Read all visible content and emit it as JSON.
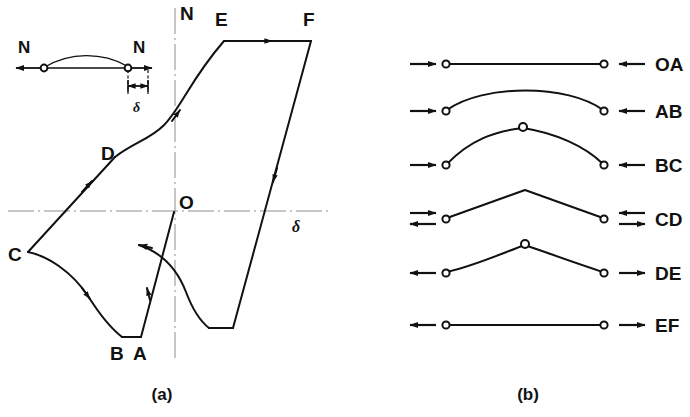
{
  "figure": {
    "panels": [
      {
        "id": "a",
        "caption": "(a)",
        "type": "load-deflection-hysteresis",
        "axes": {
          "vertical_label": "N",
          "horizontal_label": "δ"
        },
        "origin_label": "O",
        "point_labels": [
          "A",
          "B",
          "C",
          "D",
          "E",
          "F"
        ],
        "inset": {
          "left_force_label": "N",
          "right_force_label": "N",
          "dimension_label": "δ"
        }
      },
      {
        "id": "b",
        "caption": "(b)",
        "type": "strut-shape-sequence",
        "rows": [
          {
            "label": "OA",
            "shape": "straight",
            "hinge_at_apex": false,
            "left_arrows": 1,
            "right_arrows": 1,
            "left_direction": "right",
            "right_direction": "left"
          },
          {
            "label": "AB",
            "shape": "smooth-arch",
            "hinge_at_apex": false,
            "left_arrows": 1,
            "right_arrows": 1,
            "left_direction": "right",
            "right_direction": "left"
          },
          {
            "label": "BC",
            "shape": "hinged-arch",
            "hinge_at_apex": true,
            "left_arrows": 1,
            "right_arrows": 1,
            "left_direction": "right",
            "right_direction": "left"
          },
          {
            "label": "CD",
            "shape": "sharp-peak",
            "hinge_at_apex": false,
            "left_arrows": 2,
            "right_arrows": 2,
            "left_direction": "both",
            "right_direction": "both"
          },
          {
            "label": "DE",
            "shape": "hinged-arch",
            "hinge_at_apex": true,
            "left_arrows": 1,
            "right_arrows": 1,
            "left_direction": "left",
            "right_direction": "right"
          },
          {
            "label": "EF",
            "shape": "straight",
            "hinge_at_apex": false,
            "left_arrows": 1,
            "right_arrows": 1,
            "left_direction": "left",
            "right_direction": "right"
          }
        ]
      }
    ],
    "colors": {
      "ink": "#111111",
      "axis": "#8d8d8d",
      "background": "#ffffff"
    }
  }
}
